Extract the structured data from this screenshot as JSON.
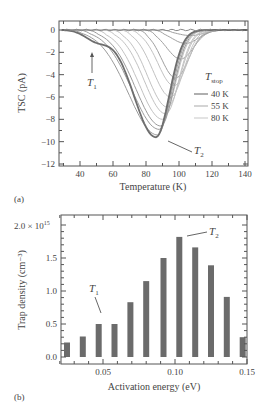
{
  "chart_data": [
    {
      "panel_label": "(a)",
      "type": "line",
      "title": "",
      "xlabel": "Temperature (K)",
      "ylabel": "TSC (pA)",
      "xlim": [
        27.5,
        142
      ],
      "ylim": [
        -12.2,
        0.6
      ],
      "xticks": [
        40,
        60,
        80,
        100,
        120,
        140
      ],
      "yticks": [
        0,
        -2,
        -4,
        -6,
        -8,
        -10,
        -12
      ],
      "xtick_labels": [
        "40",
        "60",
        "80",
        "100",
        "120",
        "140"
      ],
      "ytick_labels": [
        "0",
        "−2",
        "−4",
        "−6",
        "−8",
        "−10",
        "−12"
      ],
      "legend": {
        "title": "T",
        "title_sub": "stop",
        "entries": [
          "40 K",
          "55 K",
          "80 K"
        ],
        "position": "right-center"
      },
      "annotations": [
        {
          "text": "T",
          "sub": "1",
          "x": 47,
          "y": -3.8,
          "arrow_to": [
            47,
            -2.0
          ]
        },
        {
          "text": "T",
          "sub": "2",
          "x": 107,
          "y": -10.7,
          "arrow_to": [
            89,
            -9.8
          ]
        }
      ],
      "series": [
        {
          "name": "full",
          "peak_T": 86,
          "peak_I": -9.6
        },
        {
          "name": "T_stop 40 K",
          "peak_T": 87,
          "peak_I": -9.4
        },
        {
          "name": "T_stop ~45 K",
          "peak_T": 88,
          "peak_I": -8.9
        },
        {
          "name": "T_stop ~50 K",
          "peak_T": 89,
          "peak_I": -8.6
        },
        {
          "name": "T_stop 55 K",
          "peak_T": 90,
          "peak_I": -8.0
        },
        {
          "name": "T_stop ~60 K",
          "peak_T": 92,
          "peak_I": -7.5
        },
        {
          "name": "T_stop ~65 K",
          "peak_T": 93,
          "peak_I": -6.9
        },
        {
          "name": "T_stop ~70 K",
          "peak_T": 95,
          "peak_I": -6.0
        },
        {
          "name": "T_stop ~75 K",
          "peak_T": 97,
          "peak_I": -5.0
        },
        {
          "name": "T_stop 80 K",
          "peak_T": 98,
          "peak_I": -4.3
        },
        {
          "name": "T_stop ~85 K",
          "peak_T": 101,
          "peak_I": -2.6
        },
        {
          "name": "T_stop ~90 K",
          "peak_T": 104,
          "peak_I": -1.2
        },
        {
          "name": "T_stop ~95 K",
          "peak_T": 107,
          "peak_I": -0.5
        }
      ],
      "grid": false
    },
    {
      "panel_label": "(b)",
      "type": "bar",
      "title": "",
      "xlabel": "Activation energy (eV)",
      "ylabel": "Trap density (cm⁻³)",
      "xlim": [
        0.015,
        0.158
      ],
      "ylim": [
        -0.05,
        2.2
      ],
      "xticks": [
        0.05,
        0.1,
        0.15
      ],
      "xtick_labels": [
        "0.05",
        "0.10",
        "0.15"
      ],
      "yticks": [
        0.0,
        0.5,
        1.0,
        1.5,
        2.0
      ],
      "ytick_labels": [
        "0.0",
        "0.5",
        "1.0",
        "1.5",
        "2.0 × 10¹⁵"
      ],
      "categories": [
        0.025,
        0.036,
        0.047,
        0.058,
        0.069,
        0.08,
        0.092,
        0.103,
        0.114,
        0.125,
        0.136,
        0.147
      ],
      "values": [
        0.22,
        0.31,
        0.5,
        0.5,
        0.83,
        1.15,
        1.5,
        1.82,
        1.66,
        1.39,
        0.91,
        0.3
      ],
      "value_scale": "× 10^15 cm^-3",
      "annotations": [
        {
          "text": "T",
          "sub": "1",
          "x": 0.042,
          "y": 1.1,
          "arrow_to": [
            0.047,
            0.62
          ]
        },
        {
          "text": "T",
          "sub": "2",
          "x": 0.125,
          "y": 1.88,
          "arrow_to": [
            0.109,
            1.85
          ]
        }
      ],
      "grid": false
    }
  ],
  "labels": {
    "panel_a": "(a)",
    "panel_b": "(b)",
    "a_xlabel": "Temperature (K)",
    "a_ylabel": "TSC (pA)",
    "b_xlabel": "Activation energy (eV)",
    "b_ylabel": "Trap density (cm⁻³)",
    "legend_title": "T",
    "legend_title_sub": "stop",
    "legend_40": "40 K",
    "legend_55": "55 K",
    "legend_80": "80 K",
    "t1": "T",
    "t1_sub": "1",
    "t2": "T",
    "t2_sub": "2",
    "y_top_b": "2.0 × 10",
    "y_top_b_exp": "15"
  },
  "colors": {
    "axis": "#555555",
    "envelope": "#6e6e6e",
    "curve_light": "#c4c4c4",
    "curve_mid": "#a8a8a8",
    "bar": "#6b6b6b"
  }
}
